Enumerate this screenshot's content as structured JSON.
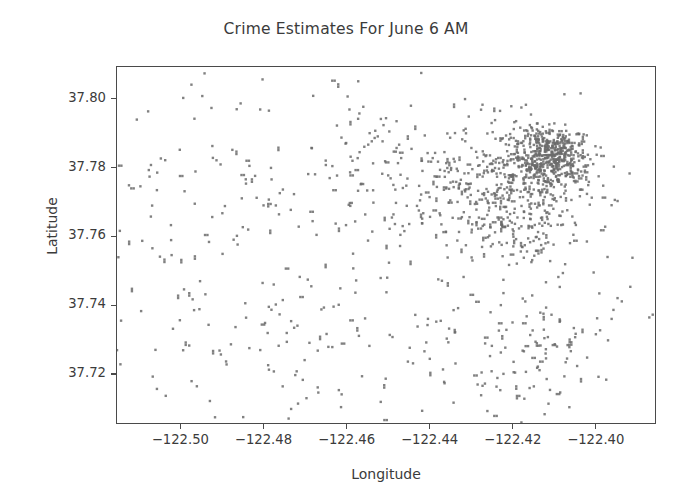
{
  "chart_data": {
    "type": "scatter",
    "title": "Crime Estimates For June 6 AM",
    "xlabel": "Longitude",
    "ylabel": "Latitude",
    "xlim": [
      -122.5155,
      -122.3855
    ],
    "ylim": [
      37.7055,
      37.8095
    ],
    "grid": false,
    "legend": null,
    "marker": {
      "shape": "square",
      "size_px": 2.4,
      "color": "#6b6b6b",
      "opacity": 0.85
    },
    "xticks": [
      -122.5,
      -122.48,
      -122.46,
      -122.44,
      -122.42,
      -122.4
    ],
    "xtick_labels": [
      "−122.50",
      "−122.48",
      "−122.46",
      "−122.44",
      "−122.42",
      "−122.40"
    ],
    "yticks": [
      37.72,
      37.74,
      37.76,
      37.78,
      37.8
    ],
    "ytick_labels": [
      "37.72",
      "37.74",
      "37.76",
      "37.78",
      "37.80"
    ],
    "point_count": 1400,
    "density_clusters": [
      {
        "name": "downtown-core",
        "cx": -122.4105,
        "cy": 37.7845,
        "sx": 0.0042,
        "sy": 0.0035,
        "weight": 330
      },
      {
        "name": "tenderloin-soma",
        "cx": -122.4155,
        "cy": 37.779,
        "sx": 0.006,
        "sy": 0.0055,
        "weight": 190
      },
      {
        "name": "mission-north",
        "cx": -122.419,
        "cy": 37.765,
        "sx": 0.0075,
        "sy": 0.0065,
        "weight": 150
      },
      {
        "name": "northeast-broad",
        "cx": -122.425,
        "cy": 37.779,
        "sx": 0.013,
        "sy": 0.011,
        "weight": 180
      },
      {
        "name": "central-corridor",
        "cx": -122.442,
        "cy": 37.776,
        "sx": 0.015,
        "sy": 0.012,
        "weight": 130
      },
      {
        "name": "south-mission-bayview",
        "cx": -122.415,
        "cy": 37.728,
        "sx": 0.014,
        "sy": 0.0095,
        "weight": 120
      },
      {
        "name": "west-sunset-richmond",
        "cx": -122.475,
        "cy": 37.76,
        "sx": 0.023,
        "sy": 0.025,
        "weight": 95
      },
      {
        "name": "southwest-sparse",
        "cx": -122.465,
        "cy": 37.725,
        "sx": 0.026,
        "sy": 0.011,
        "weight": 70
      },
      {
        "name": "far-west",
        "cx": -122.499,
        "cy": 37.766,
        "sx": 0.011,
        "sy": 0.023,
        "weight": 50
      },
      {
        "name": "uniform-background",
        "cx": -122.45,
        "cy": 37.758,
        "sx": 0.032,
        "sy": 0.029,
        "weight": 85
      }
    ]
  },
  "axes": {
    "title": "Crime Estimates For June 6 AM",
    "xlabel": "Longitude",
    "ylabel": "Latitude"
  }
}
